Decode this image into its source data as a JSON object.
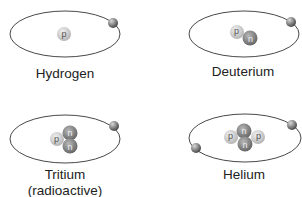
{
  "colors": {
    "orbit": "#333333",
    "proton_light": "#e6e6e6",
    "proton_dark": "#b8b8b8",
    "neutron_light": "#b0b0b0",
    "neutron_dark": "#707070",
    "electron_light": "#c8c8c8",
    "electron_dark": "#555555",
    "text": "#222222"
  },
  "particle_symbols": {
    "proton": "p",
    "neutron": "n"
  },
  "atoms": [
    {
      "name": "Hydrogen",
      "label_lines": [
        "Hydrogen"
      ],
      "protons": 1,
      "neutrons": 0,
      "electrons": 1
    },
    {
      "name": "Deuterium",
      "label_lines": [
        "Deuterium"
      ],
      "protons": 1,
      "neutrons": 1,
      "electrons": 1
    },
    {
      "name": "Tritium",
      "label_lines": [
        "Tritium",
        "(radioactive)"
      ],
      "protons": 1,
      "neutrons": 2,
      "electrons": 1
    },
    {
      "name": "Helium",
      "label_lines": [
        "Helium"
      ],
      "protons": 2,
      "neutrons": 2,
      "electrons": 2
    }
  ]
}
